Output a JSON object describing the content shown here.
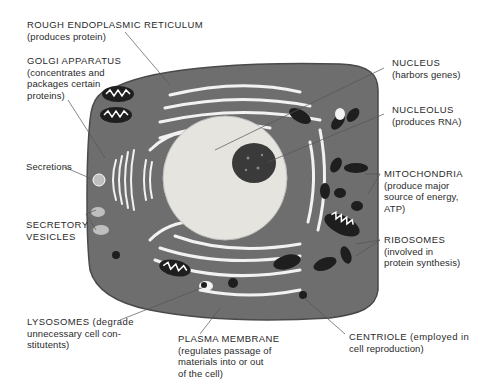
{
  "diagram": {
    "colors": {
      "cytoplasm": "#6e6e6e",
      "membrane_outline": "#4a4a4a",
      "nucleus": "#e6e4de",
      "nucleolus": "#3a3a3a",
      "er": "#f2f2f2",
      "mitochondria": "#1e1e1e",
      "leader_line": "#555555",
      "text": "#2a2a2a"
    },
    "labels": [
      {
        "id": "rough-er",
        "title": "ROUGH ENDOPLASMIC RETICULUM",
        "desc": [
          "(produces protein)"
        ]
      },
      {
        "id": "golgi",
        "title": "GOLGI APPARATUS",
        "desc": [
          "(concentrates and",
          "packages certain",
          "proteins)"
        ]
      },
      {
        "id": "nucleus",
        "title": "NUCLEUS",
        "desc": [
          "(harbors genes)"
        ]
      },
      {
        "id": "nucleolus",
        "title": "NUCLEOLUS",
        "desc": [
          "(produces RNA)"
        ]
      },
      {
        "id": "secretions",
        "title": "Secretions",
        "desc": []
      },
      {
        "id": "mitochondria",
        "title": "MITOCHONDRIA",
        "desc": [
          "(produce major",
          "source of energy,",
          "ATP)"
        ]
      },
      {
        "id": "secretory-vesicles",
        "title": "SECRETORY",
        "desc": [
          "VESICLES"
        ]
      },
      {
        "id": "ribosomes",
        "title": "RIBOSOMES",
        "desc": [
          "(involved in",
          "protein synthesis)"
        ]
      },
      {
        "id": "lysosomes",
        "title": "LYSOSOMES (degrade",
        "desc": [
          "unnecessary cell con-",
          "stitutents)"
        ]
      },
      {
        "id": "plasma-membrane",
        "title": "PLASMA MEMBRANE",
        "desc": [
          "(regulates passage of",
          "materials into or out",
          "of the cell)"
        ]
      },
      {
        "id": "centriole",
        "title": "CENTRIOLE (employed in",
        "desc": [
          "cell reproduction)"
        ]
      }
    ]
  }
}
